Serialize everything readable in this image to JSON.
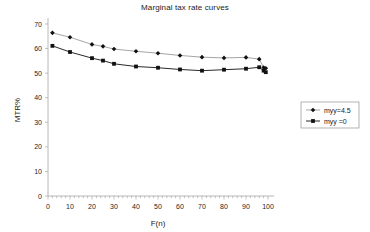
{
  "chart_data": {
    "type": "line",
    "title": "Marginal tax rate curves",
    "xlabel": "F(n)",
    "ylabel": "MTR%",
    "xlim": [
      0,
      100
    ],
    "ylim": [
      0,
      70
    ],
    "xticks": [
      0,
      10,
      20,
      30,
      40,
      50,
      60,
      70,
      80,
      90,
      100
    ],
    "yticks": [
      0,
      10,
      20,
      30,
      40,
      50,
      60,
      70
    ],
    "xtick_labels": [
      "0",
      "10",
      "20",
      "30",
      "40",
      "50",
      "60",
      "70",
      "80",
      "90",
      "100"
    ],
    "ytick_labels": [
      "0",
      "10",
      "20",
      "30",
      "40",
      "50",
      "60",
      "70"
    ],
    "grid": false,
    "legend_position": "right",
    "series": [
      {
        "name": "myy=4.5",
        "marker": "diamond",
        "x": [
          2,
          10,
          20,
          25,
          30,
          40,
          50,
          60,
          70,
          80,
          90,
          96,
          98,
          99
        ],
        "values": [
          66.4,
          64.6,
          61.7,
          60.9,
          59.8,
          58.9,
          58.1,
          57.2,
          56.5,
          56.2,
          56.4,
          55.7,
          52.3,
          52.0
        ]
      },
      {
        "name": "myy =0",
        "marker": "square",
        "x": [
          2,
          10,
          20,
          25,
          30,
          40,
          50,
          60,
          70,
          80,
          90,
          96,
          98,
          99
        ],
        "values": [
          61.1,
          58.6,
          56.1,
          55.1,
          53.8,
          52.7,
          52.2,
          51.5,
          51.0,
          51.4,
          51.8,
          52.4,
          51.0,
          50.4
        ]
      }
    ]
  },
  "legend": {
    "entries": [
      {
        "label": "myy=4.5"
      },
      {
        "label": "myy =0"
      }
    ]
  }
}
